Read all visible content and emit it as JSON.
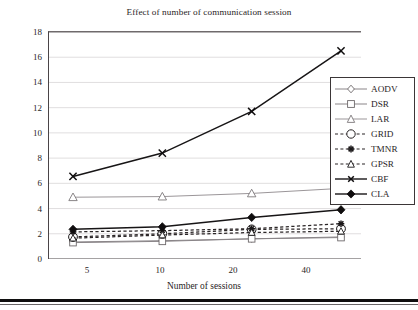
{
  "chart_data": {
    "type": "line",
    "title": "Effect of number of communication session",
    "xlabel": "Number of sessions",
    "ylabel": "Packet duplication",
    "categories": [
      "5",
      "10",
      "20",
      "40"
    ],
    "x_tick_labels": [
      "5",
      "10",
      "20",
      "40"
    ],
    "y_tick_labels": [
      "0",
      "2",
      "4",
      "6",
      "8",
      "10",
      "12",
      "14",
      "16",
      "18"
    ],
    "y_ticks": [
      0,
      2,
      4,
      6,
      8,
      10,
      12,
      14,
      16,
      18
    ],
    "ylim": [
      0,
      18
    ],
    "grid": true,
    "legend_position": "right",
    "series": [
      {
        "name": "AODV",
        "values": [
          1.35,
          1.45,
          1.6,
          1.75
        ],
        "marker": "diamond-open",
        "line_style": "solid",
        "color": "#8a8588"
      },
      {
        "name": "DSR",
        "values": [
          1.3,
          1.4,
          1.6,
          1.7
        ],
        "marker": "square-open",
        "line_style": "solid",
        "color": "#8a8588"
      },
      {
        "name": "LAR",
        "values": [
          4.9,
          4.95,
          5.2,
          5.6
        ],
        "marker": "triangle-open",
        "line_style": "solid",
        "color": "#9b9699"
      },
      {
        "name": "GRID",
        "values": [
          1.75,
          2.0,
          2.35,
          2.4
        ],
        "marker": "circle-open-large",
        "line_style": "dashed",
        "color": "#2a2526"
      },
      {
        "name": "TMNR",
        "values": [
          2.15,
          2.25,
          2.4,
          2.8
        ],
        "marker": "star",
        "line_style": "dashed",
        "color": "#2a2526"
      },
      {
        "name": "GPSR",
        "values": [
          1.65,
          1.9,
          2.1,
          2.2
        ],
        "marker": "triangle-open-small",
        "line_style": "dashed",
        "color": "#2a2526"
      },
      {
        "name": "CBF",
        "values": [
          6.55,
          8.4,
          11.7,
          16.5
        ],
        "marker": "x-cross",
        "line_style": "solid",
        "color": "#171516"
      },
      {
        "name": "CLA",
        "values": [
          2.35,
          2.55,
          3.3,
          3.9
        ],
        "marker": "diamond-filled",
        "line_style": "solid",
        "color": "#171516"
      }
    ]
  },
  "legend": {
    "entries": [
      {
        "label": "AODV"
      },
      {
        "label": "DSR"
      },
      {
        "label": "LAR"
      },
      {
        "label": "GRID"
      },
      {
        "label": "TMNR"
      },
      {
        "label": "GPSR"
      },
      {
        "label": "CBF"
      },
      {
        "label": "CLA"
      }
    ]
  }
}
